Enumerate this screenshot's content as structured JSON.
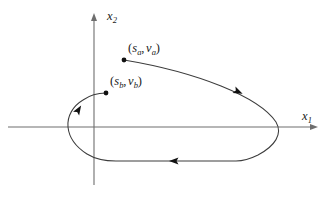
{
  "figure": {
    "kind": "phase-plane-trajectory-diagram",
    "width": 331,
    "height": 201,
    "background_color": "#ffffff",
    "stroke_color": "#3c3c3c",
    "axis_color": "#6e6e6e",
    "marker_color": "#111111"
  },
  "axes": {
    "horizontal": {
      "label_base": "x",
      "label_sub": "1",
      "label_full": "x1",
      "y_pixel": 127,
      "x_start": 8,
      "x_end": 318,
      "arrow": "right"
    },
    "vertical": {
      "label_base": "x",
      "label_sub": "2",
      "label_full": "x2",
      "x_pixel": 94,
      "y_start": 13,
      "y_end": 185,
      "arrow": "up"
    },
    "origin": {
      "x": 94,
      "y": 127
    },
    "ticks": [],
    "grid": false
  },
  "points": [
    {
      "id": "point-a",
      "label_open": "(",
      "label_s": "s",
      "label_s_sub": "a",
      "label_comma": ",",
      "label_v": "v",
      "label_v_sub": "a",
      "label_close": ")",
      "label_full": "(sa, va)",
      "marker_x": 124,
      "marker_y": 60,
      "label_x": 128,
      "label_y": 42
    },
    {
      "id": "point-b",
      "label_open": "(",
      "label_s": "s",
      "label_s_sub": "b",
      "label_comma": ",",
      "label_v": "v",
      "label_v_sub": "b",
      "label_close": ")",
      "label_full": "(sb, vb)",
      "marker_x": 106,
      "marker_y": 93,
      "label_x": 110,
      "label_y": 75
    }
  ],
  "trajectory": {
    "description": "Closed clockwise orbit from point a around to point b",
    "direction": "clockwise",
    "path": "M 124,60 C 160,66 196,76 221,86 C 248,97 268,110 276,122 C 283,134 275,146 258,155 C 250,159 243,161 236,161 L 116,161 C 104,161 95,159 87,154 C 76,147 69,137 68,127 C 67,116 73,106 83,100 C 90,95 98,93 106,93",
    "arrows": [
      {
        "id": "arrow-upper-right",
        "x": 239,
        "y": 92,
        "angle_deg": 24
      },
      {
        "id": "arrow-bottom",
        "x": 173,
        "y": 161,
        "angle_deg": 180
      },
      {
        "id": "arrow-left",
        "x": 79,
        "y": 109,
        "angle_deg": -58
      }
    ]
  }
}
